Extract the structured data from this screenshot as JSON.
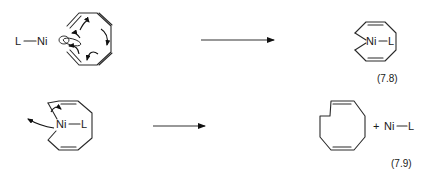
{
  "diagram": {
    "type": "reaction-scheme",
    "reactions": [
      {
        "equation_label": "(7.8)",
        "reactant": {
          "name": "L-Ni + cyclooctatetraene-like ring with curly arrows",
          "labels": {
            "ligand": "L",
            "metal": "Ni"
          }
        },
        "arrow": "→",
        "product": {
          "name": "nickelacycle",
          "labels": {
            "metal": "Ni",
            "ligand": "L"
          }
        }
      },
      {
        "equation_label": "(7.9)",
        "reactant": {
          "name": "nickelacycle with curly arrows",
          "labels": {
            "metal": "Ni",
            "ligand": "L"
          }
        },
        "arrow": "→",
        "product": {
          "name": "1,5-cyclooctadiene",
          "plus": "+",
          "byproduct_labels": {
            "metal": "Ni",
            "ligand": "L"
          }
        }
      }
    ]
  }
}
